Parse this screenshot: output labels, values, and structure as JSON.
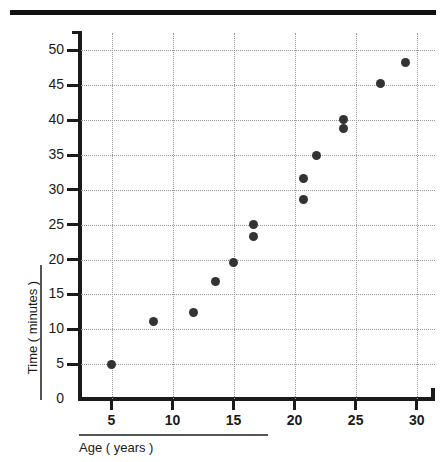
{
  "chart_data": {
    "type": "scatter",
    "title": "",
    "xlabel": "Age ( years )",
    "ylabel": "Time ( minutes )",
    "xlim": [
      2.5,
      31.5
    ],
    "ylim": [
      0,
      52.5
    ],
    "xticks": [
      5,
      10,
      15,
      20,
      25,
      30
    ],
    "xtick_labels": [
      "5",
      "10",
      "15",
      "20",
      "25",
      "30"
    ],
    "yticks": [
      0,
      5,
      10,
      15,
      20,
      25,
      30,
      35,
      40,
      45,
      50
    ],
    "ytick_labels": [
      "0",
      "5",
      "10",
      "15",
      "20",
      "25",
      "30",
      "35",
      "40",
      "45",
      "50"
    ],
    "grid": true,
    "grid_style": "dotted",
    "legend": "none",
    "marker_color": "#333333",
    "points": [
      {
        "x": 5.0,
        "y": 5.0
      },
      {
        "x": 8.4,
        "y": 11.1
      },
      {
        "x": 11.7,
        "y": 12.4
      },
      {
        "x": 13.5,
        "y": 16.8
      },
      {
        "x": 15.0,
        "y": 19.6
      },
      {
        "x": 16.6,
        "y": 25.1
      },
      {
        "x": 16.6,
        "y": 23.3
      },
      {
        "x": 20.7,
        "y": 31.6
      },
      {
        "x": 20.7,
        "y": 28.6
      },
      {
        "x": 21.8,
        "y": 35.0
      },
      {
        "x": 24.0,
        "y": 40.1
      },
      {
        "x": 24.0,
        "y": 38.8
      },
      {
        "x": 27.0,
        "y": 45.3
      },
      {
        "x": 29.1,
        "y": 48.2
      }
    ]
  },
  "decor": {
    "top_rule": "top-divider-bar"
  }
}
